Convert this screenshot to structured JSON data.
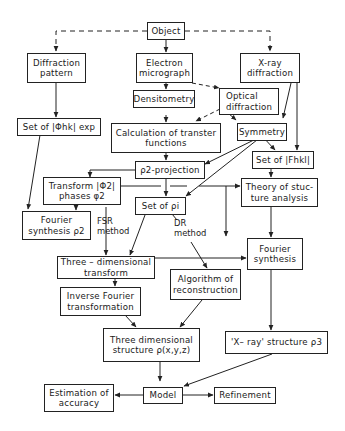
{
  "diagram": {
    "type": "flowchart",
    "nodes": {
      "object": {
        "lines": [
          "Object"
        ]
      },
      "diffraction_pattern": {
        "lines": [
          "Diffraction",
          "pattern"
        ]
      },
      "electron_micrograph": {
        "lines": [
          "Electron",
          "micrograph"
        ]
      },
      "xray_diffraction": {
        "lines": [
          "X-ray",
          "diffraction"
        ]
      },
      "densitometry": {
        "lines": [
          "Densitometry"
        ]
      },
      "optical_diffraction": {
        "lines": [
          "Optical",
          "diffraction"
        ]
      },
      "set_phi_hk_exp": {
        "lines": [
          "Set of |Φhk| exp"
        ]
      },
      "calc_transfer": {
        "lines": [
          "Calculation of transter",
          "functions"
        ]
      },
      "symmetry": {
        "lines": [
          "Symmetry"
        ]
      },
      "rho2_projection": {
        "lines": [
          "ρ2-projection"
        ]
      },
      "set_F_hkl": {
        "lines": [
          "Set of |Fhkl|"
        ]
      },
      "transform_phi2": {
        "lines": [
          "Transform |Φ2|",
          "phases φ2"
        ]
      },
      "set_rho_i": {
        "lines": [
          "Set of ρi"
        ]
      },
      "theory_structure": {
        "lines": [
          "Theory of stuc-",
          "ture analysis"
        ]
      },
      "fourier_synthesis_rho2": {
        "lines": [
          "Fourier",
          "synthesis ρ2"
        ]
      },
      "three_dim_transform": {
        "lines": [
          "Three – dimensional",
          "transform"
        ]
      },
      "fourier_synthesis": {
        "lines": [
          "Fourier",
          "synthesis"
        ]
      },
      "algorithm_reconstruction": {
        "lines": [
          "Algorithm of",
          "reconstruction"
        ]
      },
      "inverse_fourier": {
        "lines": [
          "Inverse Fourier",
          "transformation"
        ]
      },
      "three_dim_structure": {
        "lines": [
          "Three dimensional",
          "structure ρ(x,y,z)"
        ]
      },
      "xray_structure": {
        "lines": [
          "'X– ray' structure ρ3"
        ]
      },
      "estimation_accuracy": {
        "lines": [
          "Estimation of",
          "accuracy"
        ]
      },
      "model": {
        "lines": [
          "Model"
        ]
      },
      "refinement": {
        "lines": [
          "Refinement"
        ]
      }
    },
    "edge_labels": {
      "fsr_method": [
        "FSR",
        "method"
      ],
      "dr_method": [
        "DR",
        "method"
      ]
    },
    "edges": [
      {
        "from": "object",
        "to": "diffraction_pattern",
        "style": "dashed"
      },
      {
        "from": "object",
        "to": "electron_micrograph",
        "style": "solid"
      },
      {
        "from": "object",
        "to": "xray_diffraction",
        "style": "dashed"
      },
      {
        "from": "electron_micrograph",
        "to": "densitometry",
        "style": "solid"
      },
      {
        "from": "electron_micrograph",
        "to": "optical_diffraction",
        "style": "dashed"
      },
      {
        "from": "optical_diffraction",
        "to": "calc_transfer",
        "style": "dashed"
      },
      {
        "from": "optical_diffraction",
        "to": "symmetry",
        "style": "solid"
      },
      {
        "from": "xray_diffraction",
        "to": "symmetry",
        "style": "solid"
      },
      {
        "from": "xray_diffraction",
        "to": "set_F_hkl",
        "style": "solid"
      },
      {
        "from": "diffraction_pattern",
        "to": "set_phi_hk_exp",
        "style": "solid"
      },
      {
        "from": "densitometry",
        "to": "calc_transfer",
        "style": "solid"
      },
      {
        "from": "calc_transfer",
        "to": "rho2_projection",
        "style": "solid"
      },
      {
        "from": "symmetry",
        "to": "rho2_projection",
        "style": "solid"
      },
      {
        "from": "symmetry",
        "to": "set_rho_i",
        "style": "solid"
      },
      {
        "from": "symmetry",
        "to": "set_F_hkl",
        "style": "solid"
      },
      {
        "from": "set_F_hkl",
        "to": "theory_structure",
        "style": "solid"
      },
      {
        "from": "rho2_projection",
        "to": "transform_phi2",
        "style": "solid"
      },
      {
        "from": "rho2_projection",
        "to": "set_rho_i",
        "style": "solid"
      },
      {
        "from": "transform_phi2",
        "to": "theory_structure",
        "style": "solid"
      },
      {
        "from": "set_phi_hk_exp",
        "to": "fourier_synthesis_rho2",
        "style": "solid"
      },
      {
        "from": "transform_phi2",
        "to": "fourier_synthesis_rho2",
        "style": "solid"
      },
      {
        "from": "transform_phi2",
        "to": "three_dim_transform",
        "label": "fsr_method",
        "style": "solid"
      },
      {
        "from": "set_rho_i",
        "to": "three_dim_transform",
        "style": "solid"
      },
      {
        "from": "set_rho_i",
        "to": "algorithm_reconstruction",
        "label": "dr_method",
        "style": "solid"
      },
      {
        "from": "theory_structure",
        "to": "fourier_synthesis",
        "style": "solid"
      },
      {
        "from": "three_dim_transform",
        "to": "fourier_synthesis",
        "style": "solid"
      },
      {
        "from": "three_dim_transform",
        "to": "inverse_fourier",
        "style": "solid"
      },
      {
        "from": "inverse_fourier",
        "to": "three_dim_structure",
        "style": "solid"
      },
      {
        "from": "algorithm_reconstruction",
        "to": "three_dim_structure",
        "style": "solid"
      },
      {
        "from": "fourier_synthesis",
        "to": "xray_structure",
        "style": "solid"
      },
      {
        "from": "three_dim_structure",
        "to": "model",
        "style": "solid"
      },
      {
        "from": "xray_structure",
        "to": "model",
        "style": "solid"
      },
      {
        "from": "model",
        "to": "estimation_accuracy",
        "style": "solid"
      },
      {
        "from": "model",
        "to": "refinement",
        "style": "solid"
      }
    ]
  }
}
